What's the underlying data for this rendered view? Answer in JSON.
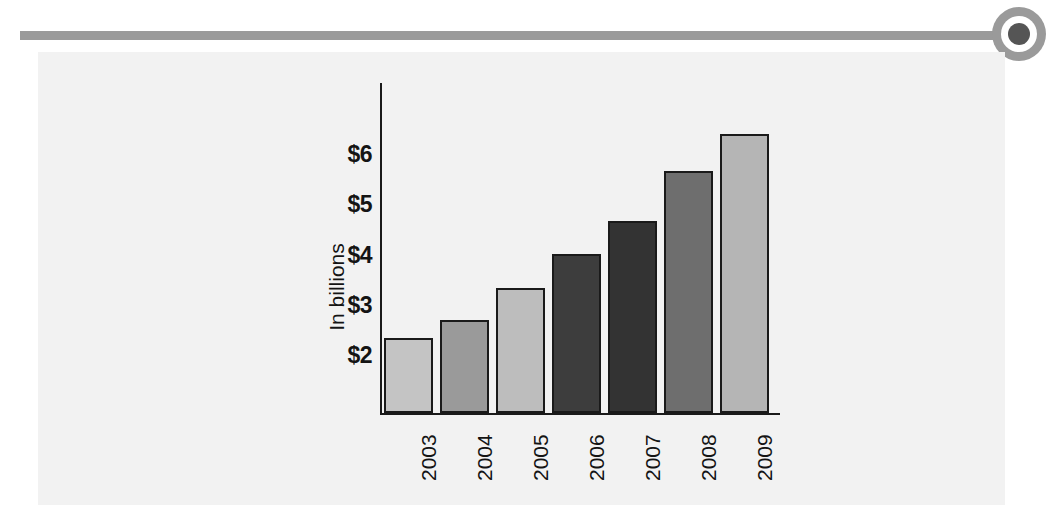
{
  "header": {
    "rule_color": "#9a9a9a",
    "bullet_icon": "target-bullet-icon",
    "bullet_dot_color": "#555555"
  },
  "panel": {
    "background_color": "#f2f2f2"
  },
  "chart_data": {
    "type": "bar",
    "title": "",
    "subtitle": "",
    "xlabel": "",
    "ylabel": "In billions",
    "categories": [
      "2003",
      "2004",
      "2005",
      "2006",
      "2007",
      "2008",
      "2009"
    ],
    "values": [
      2.4,
      2.75,
      3.4,
      4.07,
      4.73,
      5.73,
      6.45
    ],
    "ytick_labels": [
      "$2",
      "$3",
      "$4",
      "$5",
      "$6"
    ],
    "ytick_values": [
      2,
      3,
      4,
      5,
      6
    ],
    "ylim": [
      0.91,
      6.8
    ],
    "grid": false,
    "legend": false,
    "legend_position": "none",
    "bar_colors": [
      "#c4c4c4",
      "#9a9a9a",
      "#bdbdbd",
      "#3d3d3d",
      "#333333",
      "#6e6e6e",
      "#b5b5b5"
    ],
    "bar_border_color": "#1a1a1a",
    "axis_color": "#1a1a1a",
    "series": [
      {
        "name": "Amount",
        "values": [
          2.4,
          2.75,
          3.4,
          4.07,
          4.73,
          5.73,
          6.45
        ]
      }
    ],
    "points": [
      {
        "category": "2003",
        "value": 2.4
      },
      {
        "category": "2004",
        "value": 2.75
      },
      {
        "category": "2005",
        "value": 3.4
      },
      {
        "category": "2006",
        "value": 4.07
      },
      {
        "category": "2007",
        "value": 4.73
      },
      {
        "category": "2008",
        "value": 5.73
      },
      {
        "category": "2009",
        "value": 6.45
      }
    ]
  }
}
